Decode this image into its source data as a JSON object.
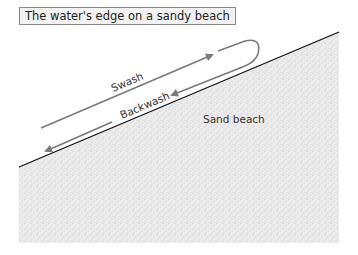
{
  "title": "The water's edge on a sandy beach",
  "labels": {
    "swash": "Swash",
    "backwash": "Backwash",
    "sand_beach": "Sand beach"
  },
  "colors": {
    "arrow": "#7a7a7a",
    "beach_line": "#111111",
    "sand_fill": "#e6e6e6",
    "title_bg": "#f2f2f2"
  }
}
